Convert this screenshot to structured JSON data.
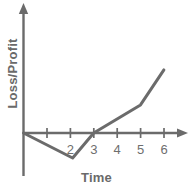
{
  "chart_data": {
    "type": "line",
    "title": "",
    "xlabel": "Time",
    "ylabel": "Loss/Profit",
    "xlim": [
      0,
      7
    ],
    "ylim": [
      -1.2,
      3.0
    ],
    "grid": false,
    "legend": null,
    "x_ticks": [
      1,
      2,
      3,
      4,
      5,
      6
    ],
    "x_tick_labels": [
      "",
      "2",
      "3",
      "4",
      "5",
      "6"
    ],
    "y_ticks": [],
    "y_tick_labels": [],
    "zero_line": 0,
    "series": [
      {
        "name": "Loss/Profit",
        "color": "#6b6b6b",
        "x": [
          0,
          2.1,
          3.0,
          5.0,
          6.0
        ],
        "y": [
          0,
          -1.05,
          0,
          1.18,
          2.65
        ]
      }
    ],
    "annotations": []
  },
  "axes": {
    "x_title": "Time",
    "y_title": "Loss/Profit",
    "tick_labels": {
      "t2": "2",
      "t3": "3",
      "t4": "4",
      "t5": "5",
      "t6": "6"
    }
  },
  "colors": {
    "line": "#6b6b6b",
    "axis": "#6b6b6b",
    "text": "#6a6a6a",
    "background": "#ffffff"
  }
}
